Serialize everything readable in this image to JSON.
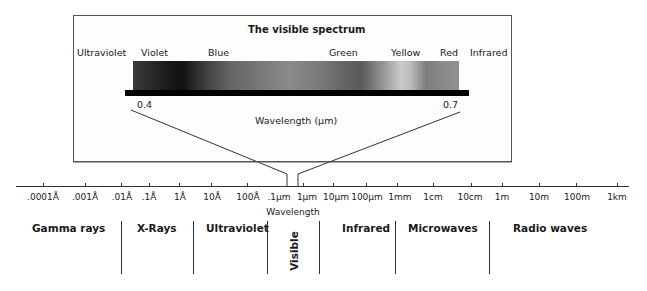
{
  "inset": {
    "title": "The visible spectrum",
    "color_labels": [
      {
        "label": "Ultraviolet",
        "x": 77
      },
      {
        "label": "Violet",
        "x": 141
      },
      {
        "label": "Blue",
        "x": 208
      },
      {
        "label": "Green",
        "x": 329
      },
      {
        "label": "Yellow",
        "x": 391
      },
      {
        "label": "Red",
        "x": 440
      },
      {
        "label": "Infrared",
        "x": 470
      }
    ],
    "scale_min": "0.4",
    "scale_max": "0.7",
    "axis_label": "Wavelength (µm)"
  },
  "main_axis": {
    "label": "Wavelength",
    "ticks": [
      {
        "label": ".0001Å",
        "x": 43
      },
      {
        "label": ".001Å",
        "x": 85
      },
      {
        "label": ".01Å",
        "x": 121
      },
      {
        "label": ".1Å",
        "x": 149
      },
      {
        "label": "1Å",
        "x": 179
      },
      {
        "label": "10Å",
        "x": 211
      },
      {
        "label": "100Å",
        "x": 247
      },
      {
        "label": ".1µm",
        "x": 279
      },
      {
        "label": "1µm",
        "x": 307
      },
      {
        "label": "10µm",
        "x": 336
      },
      {
        "label": "100µm",
        "x": 366
      },
      {
        "label": "1mm",
        "x": 397
      },
      {
        "label": "1cm",
        "x": 433
      },
      {
        "label": "10cm",
        "x": 471
      },
      {
        "label": "1m",
        "x": 502
      },
      {
        "label": "10m",
        "x": 539
      },
      {
        "label": "100m",
        "x": 576
      },
      {
        "label": "1km",
        "x": 617
      }
    ]
  },
  "bands": [
    {
      "label": "Gamma rays",
      "x": 32
    },
    {
      "label": "X-Rays",
      "x": 137
    },
    {
      "label": "Ultraviolet",
      "x": 206
    },
    {
      "label": "Visible",
      "rotated": true
    },
    {
      "label": "Infrared",
      "x": 342
    },
    {
      "label": "Microwaves",
      "x": 408
    },
    {
      "label": "Radio waves",
      "x": 513
    }
  ],
  "dividers_x": [
    121,
    193,
    267,
    319,
    395,
    489
  ]
}
